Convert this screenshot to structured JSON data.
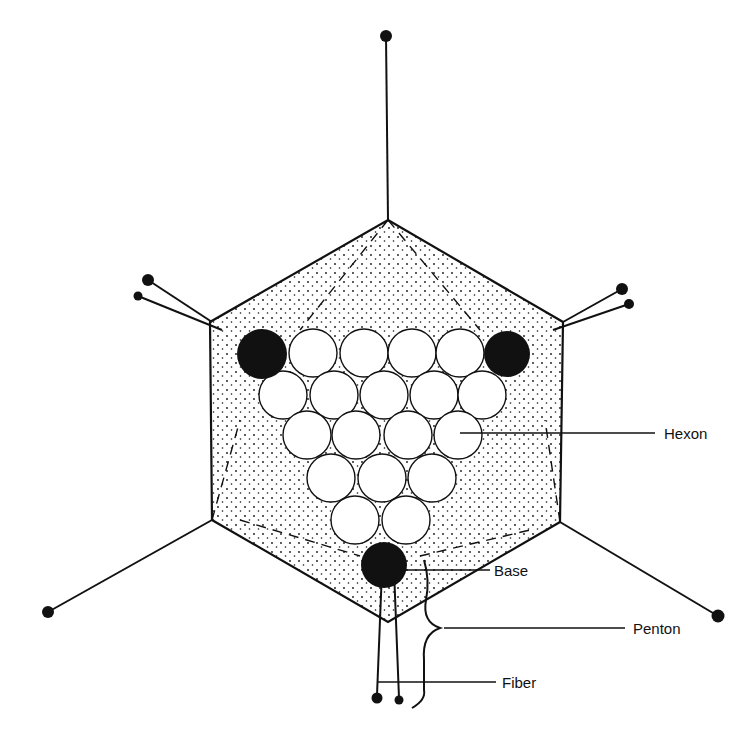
{
  "diagram": {
    "type": "adenovirus icosahedral capsid schematic",
    "colors": {
      "ink": "#111111",
      "background": "#ffffff"
    },
    "labels": [
      {
        "id": "hexon",
        "text": "Hexon",
        "x": 664,
        "y": 426
      },
      {
        "id": "base",
        "text": "Base",
        "x": 494,
        "y": 566
      },
      {
        "id": "penton",
        "text": "Penton",
        "x": 633,
        "y": 621
      },
      {
        "id": "fiber",
        "text": "Fiber",
        "x": 502,
        "y": 676
      }
    ],
    "components": [
      "hexagonal capsid outline",
      "hexon capsomers (20 circles)",
      "penton bases (3 filled circles)",
      "fibers with knobs"
    ]
  }
}
